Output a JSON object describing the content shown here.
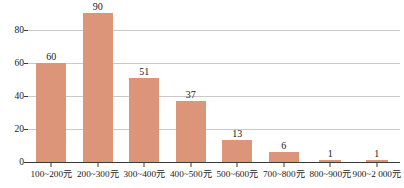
{
  "chart_data": {
    "type": "bar",
    "title": "",
    "xlabel": "",
    "ylabel": "",
    "categories": [
      "100~200元",
      "200~300元",
      "300~400元",
      "400~500元",
      "500~600元",
      "700~800元",
      "800~900元",
      "900~2 000元"
    ],
    "values": [
      60,
      90,
      51,
      37,
      13,
      6,
      1,
      1
    ],
    "value_labels": [
      "60",
      "90",
      "51",
      "37",
      "13",
      "6",
      "1",
      "1"
    ],
    "yticks": [
      0,
      20,
      40,
      60,
      80
    ],
    "ytick_labels": [
      "0",
      "20",
      "40",
      "60",
      "80"
    ],
    "ylim": [
      0,
      93
    ],
    "grid": true,
    "legend": false,
    "bar_color": "#dc9579",
    "gridline_color": "#c9c9c9",
    "axis_color": "#3a3a3a",
    "text_color": "#1a1a1a"
  }
}
